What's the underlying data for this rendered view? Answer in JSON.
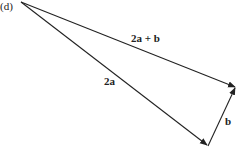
{
  "figure": {
    "part_label": "(d)",
    "stroke_color": "#222222",
    "background": "#ffffff"
  },
  "vectors": [
    {
      "id": "2a",
      "label": "2a",
      "from": [
        21,
        2
      ],
      "to": [
        208,
        146
      ]
    },
    {
      "id": "b",
      "label": "b",
      "from": [
        208,
        146
      ],
      "to": [
        236,
        87
      ]
    },
    {
      "id": "sum",
      "label": "2a + b",
      "from": [
        21,
        2
      ],
      "to": [
        236,
        87
      ]
    }
  ],
  "labels": {
    "sum": "2a + b",
    "two_a": "2a",
    "b": "b"
  }
}
